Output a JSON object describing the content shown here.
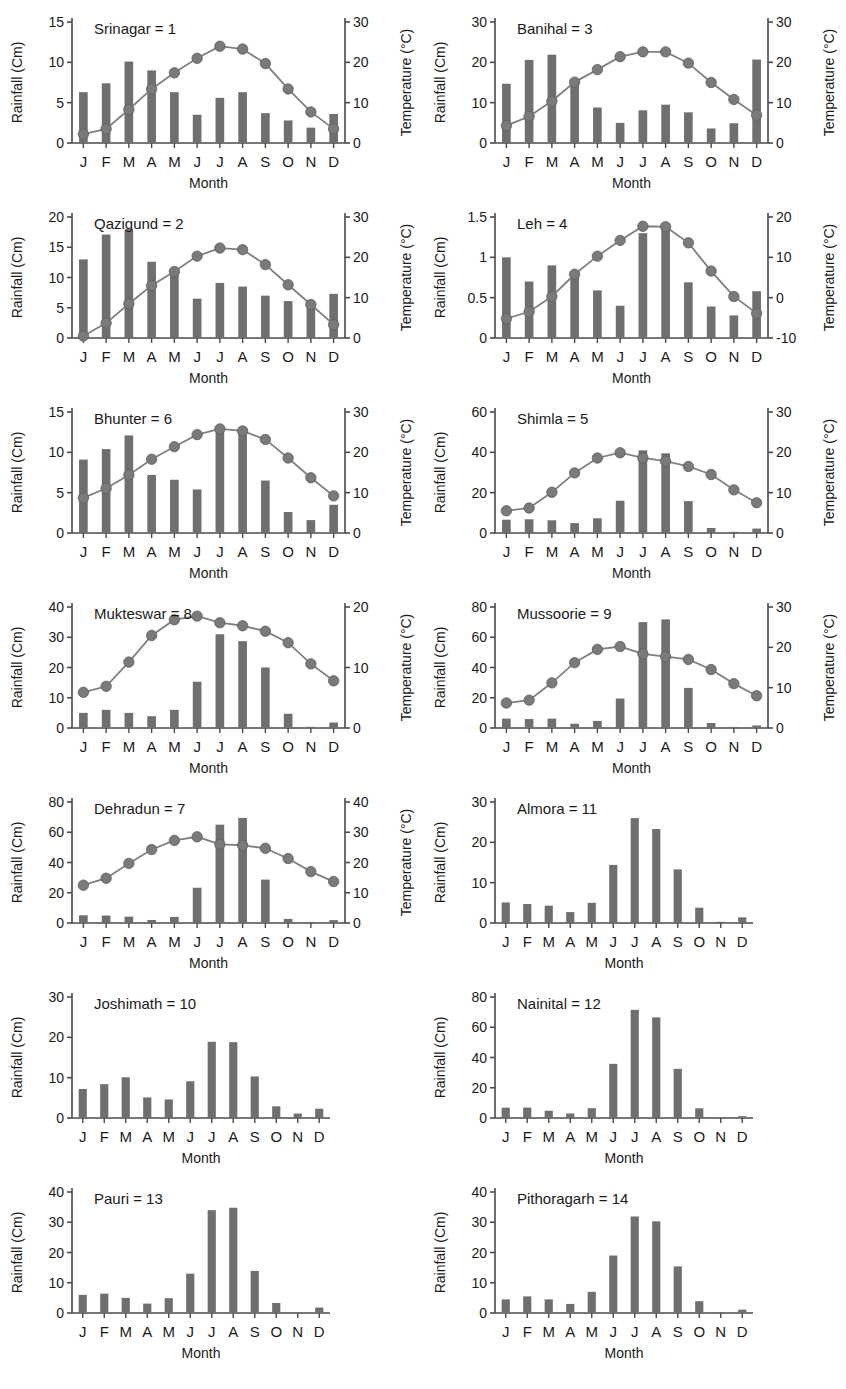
{
  "figure": {
    "bar_color": "#6f6f6f",
    "line_color": "#808080",
    "marker_color": "#7a7a7a",
    "axis_color": "#4a4a4a",
    "months": [
      "J",
      "F",
      "M",
      "A",
      "M",
      "J",
      "J",
      "A",
      "S",
      "O",
      "N",
      "D"
    ],
    "xlabel": "Month",
    "ylabel_left": "Rainfall (Cm)",
    "ylabel_right": "Temperature (°C)"
  },
  "chart_data": [
    {
      "type": "bar",
      "title": "Srinagar = 1",
      "station": "Srinagar",
      "index": 1,
      "xlabel": "Month",
      "ylabel": "Rainfall (Cm)",
      "ylabel2": "Temperature (°C)",
      "categories": [
        "J",
        "F",
        "M",
        "A",
        "M",
        "J",
        "J",
        "A",
        "S",
        "O",
        "N",
        "D"
      ],
      "ylim": [
        0,
        15
      ],
      "yticks": [
        0,
        5,
        10,
        15
      ],
      "ylim2": [
        0,
        30
      ],
      "yticks2": [
        0,
        10,
        20,
        30
      ],
      "grid": false,
      "series": [
        {
          "name": "Rainfall",
          "type": "bar",
          "axis": "left",
          "values": [
            6.3,
            7.4,
            10.1,
            9.0,
            6.3,
            3.5,
            5.6,
            6.3,
            3.7,
            2.8,
            1.9,
            3.6
          ]
        },
        {
          "name": "Temperature",
          "type": "line",
          "axis": "right",
          "values": [
            2.2,
            3.5,
            8.3,
            13.4,
            17.4,
            21.0,
            24.0,
            23.3,
            19.7,
            13.4,
            7.7,
            3.5
          ]
        }
      ]
    },
    {
      "type": "bar",
      "title": "Banihal = 3",
      "station": "Banihal",
      "index": 3,
      "xlabel": "Month",
      "ylabel": "Rainfall (Cm)",
      "ylabel2": "Temperature (°C)",
      "categories": [
        "J",
        "F",
        "M",
        "A",
        "M",
        "J",
        "J",
        "A",
        "S",
        "O",
        "N",
        "D"
      ],
      "ylim": [
        0,
        30
      ],
      "yticks": [
        0,
        10,
        20,
        30
      ],
      "ylim2": [
        0,
        30
      ],
      "yticks2": [
        0,
        10,
        20,
        30
      ],
      "grid": false,
      "series": [
        {
          "name": "Rainfall",
          "type": "bar",
          "axis": "left",
          "values": [
            14.7,
            20.6,
            21.9,
            14.6,
            8.8,
            5.0,
            8.1,
            9.5,
            7.6,
            3.6,
            4.9,
            20.7
          ]
        },
        {
          "name": "Temperature",
          "type": "line",
          "axis": "right",
          "values": [
            4.3,
            6.6,
            10.4,
            15.1,
            18.2,
            21.4,
            22.6,
            22.6,
            19.8,
            15.0,
            10.8,
            6.9
          ]
        }
      ]
    },
    {
      "type": "bar",
      "title": "Qazigund = 2",
      "station": "Qazigund",
      "index": 2,
      "xlabel": "Month",
      "ylabel": "Rainfall (Cm)",
      "ylabel2": "Temperature (°C)",
      "categories": [
        "J",
        "F",
        "M",
        "A",
        "M",
        "J",
        "J",
        "A",
        "S",
        "O",
        "N",
        "D"
      ],
      "ylim": [
        0,
        20
      ],
      "yticks": [
        0,
        5,
        10,
        15,
        20
      ],
      "ylim2": [
        0,
        30
      ],
      "yticks2": [
        0,
        10,
        20,
        30
      ],
      "grid": false,
      "series": [
        {
          "name": "Rainfall",
          "type": "bar",
          "axis": "left",
          "values": [
            13.0,
            17.1,
            18.0,
            12.6,
            10.9,
            6.5,
            9.1,
            8.5,
            7.0,
            6.1,
            5.5,
            7.3
          ]
        },
        {
          "name": "Temperature",
          "type": "line",
          "axis": "right",
          "values": [
            0.5,
            3.7,
            8.5,
            13.0,
            16.5,
            20.3,
            22.3,
            21.9,
            18.2,
            13.2,
            8.3,
            3.3
          ]
        }
      ]
    },
    {
      "type": "bar",
      "title": "Leh = 4",
      "station": "Leh",
      "index": 4,
      "xlabel": "Month",
      "ylabel": "Rainfall (Cm)",
      "ylabel2": "Temperature (°C)",
      "categories": [
        "J",
        "F",
        "M",
        "A",
        "M",
        "J",
        "J",
        "A",
        "S",
        "O",
        "N",
        "D"
      ],
      "ylim": [
        0,
        1.5
      ],
      "yticks": [
        0,
        0.5,
        1,
        1.5
      ],
      "ylim2": [
        -10,
        20
      ],
      "yticks2": [
        -10,
        0,
        10,
        20
      ],
      "grid": false,
      "series": [
        {
          "name": "Rainfall",
          "type": "bar",
          "axis": "left",
          "values": [
            1.0,
            0.7,
            0.9,
            0.81,
            0.59,
            0.4,
            1.3,
            1.38,
            0.69,
            0.39,
            0.28,
            0.58
          ]
        },
        {
          "name": "Temperature",
          "type": "line",
          "axis": "right",
          "values": [
            -5.2,
            -3.5,
            0.3,
            5.8,
            10.3,
            14.2,
            17.7,
            17.6,
            13.6,
            6.6,
            0.3,
            -3.9
          ]
        }
      ]
    },
    {
      "type": "bar",
      "title": "Bhunter = 6",
      "station": "Bhunter",
      "index": 6,
      "xlabel": "Month",
      "ylabel": "Rainfall (Cm)",
      "ylabel2": "Temperature (°C)",
      "categories": [
        "J",
        "F",
        "M",
        "A",
        "M",
        "J",
        "J",
        "A",
        "S",
        "O",
        "N",
        "D"
      ],
      "ylim": [
        0,
        15
      ],
      "yticks": [
        0,
        5,
        10,
        15
      ],
      "ylim2": [
        0,
        30
      ],
      "yticks2": [
        0,
        10,
        20,
        30
      ],
      "grid": false,
      "series": [
        {
          "name": "Rainfall",
          "type": "bar",
          "axis": "left",
          "values": [
            9.1,
            10.4,
            12.1,
            7.2,
            6.6,
            5.4,
            13.0,
            12.8,
            6.5,
            2.6,
            1.6,
            3.5
          ]
        },
        {
          "name": "Temperature",
          "type": "line",
          "axis": "right",
          "values": [
            8.7,
            11.1,
            14.4,
            18.3,
            21.4,
            24.4,
            25.8,
            25.3,
            23.2,
            18.6,
            13.7,
            9.2
          ]
        }
      ]
    },
    {
      "type": "bar",
      "title": "Shimla = 5",
      "station": "Shimla",
      "index": 5,
      "xlabel": "Month",
      "ylabel": "Rainfall (Cm)",
      "ylabel2": "Temperature (°C)",
      "categories": [
        "J",
        "F",
        "M",
        "A",
        "M",
        "J",
        "J",
        "A",
        "S",
        "O",
        "N",
        "D"
      ],
      "ylim": [
        0,
        60
      ],
      "yticks": [
        0,
        20,
        40,
        60
      ],
      "ylim2": [
        0,
        30
      ],
      "yticks2": [
        0,
        10,
        20,
        30
      ],
      "grid": false,
      "series": [
        {
          "name": "Rainfall",
          "type": "bar",
          "axis": "left",
          "values": [
            6.6,
            6.8,
            6.3,
            4.9,
            7.3,
            16.0,
            41.0,
            39.5,
            15.8,
            2.5,
            0.6,
            2.2
          ]
        },
        {
          "name": "Temperature",
          "type": "line",
          "axis": "right",
          "values": [
            5.5,
            6.2,
            10.1,
            14.9,
            18.6,
            19.9,
            18.6,
            17.8,
            16.5,
            14.5,
            10.7,
            7.5
          ]
        }
      ]
    },
    {
      "type": "bar",
      "title": "Mukteswar = 8",
      "station": "Mukteswar",
      "index": 8,
      "xlabel": "Month",
      "ylabel": "Rainfall (Cm)",
      "ylabel2": "Temperature (°C)",
      "categories": [
        "J",
        "F",
        "M",
        "A",
        "M",
        "J",
        "J",
        "A",
        "S",
        "O",
        "N",
        "D"
      ],
      "ylim": [
        0,
        40
      ],
      "yticks": [
        0,
        10,
        20,
        30,
        40
      ],
      "ylim2": [
        0,
        20
      ],
      "yticks2": [
        0,
        10,
        20
      ],
      "grid": false,
      "series": [
        {
          "name": "Rainfall",
          "type": "bar",
          "axis": "left",
          "values": [
            5.0,
            6.0,
            5.0,
            3.9,
            6.0,
            15.3,
            31.0,
            28.7,
            20.0,
            4.7,
            0.4,
            1.8
          ]
        },
        {
          "name": "Temperature",
          "type": "line",
          "axis": "right",
          "values": [
            5.9,
            6.9,
            10.9,
            15.3,
            17.9,
            18.5,
            17.4,
            16.9,
            16.0,
            14.1,
            10.6,
            7.8
          ]
        }
      ]
    },
    {
      "type": "bar",
      "title": "Mussoorie = 9",
      "station": "Mussoorie",
      "index": 9,
      "xlabel": "Month",
      "ylabel": "Rainfall (Cm)",
      "ylabel2": "Temperature (°C)",
      "categories": [
        "J",
        "F",
        "M",
        "A",
        "M",
        "J",
        "J",
        "A",
        "S",
        "O",
        "N",
        "D"
      ],
      "ylim": [
        0,
        80
      ],
      "yticks": [
        0,
        20,
        40,
        60,
        80
      ],
      "ylim2": [
        0,
        30
      ],
      "yticks2": [
        0,
        10,
        20,
        30
      ],
      "grid": false,
      "series": [
        {
          "name": "Rainfall",
          "type": "bar",
          "axis": "left",
          "values": [
            6.2,
            5.9,
            6.2,
            2.8,
            4.7,
            19.5,
            70.0,
            71.8,
            26.5,
            3.3,
            0.7,
            1.7
          ]
        },
        {
          "name": "Temperature",
          "type": "line",
          "axis": "right",
          "values": [
            6.2,
            6.9,
            11.2,
            16.2,
            19.5,
            20.2,
            18.4,
            17.7,
            17.0,
            14.5,
            11.0,
            8.0
          ]
        }
      ]
    },
    {
      "type": "bar",
      "title": "Dehradun = 7",
      "station": "Dehradun",
      "index": 7,
      "xlabel": "Month",
      "ylabel": "Rainfall (Cm)",
      "ylabel2": "Temperature (°C)",
      "categories": [
        "J",
        "F",
        "M",
        "A",
        "M",
        "J",
        "J",
        "A",
        "S",
        "O",
        "N",
        "D"
      ],
      "ylim": [
        0,
        80
      ],
      "yticks": [
        0,
        20,
        40,
        60,
        80
      ],
      "ylim2": [
        0,
        40
      ],
      "yticks2": [
        0,
        10,
        20,
        30,
        40
      ],
      "grid": false,
      "series": [
        {
          "name": "Rainfall",
          "type": "bar",
          "axis": "left",
          "values": [
            5.1,
            4.9,
            4.2,
            2.0,
            4.0,
            23.3,
            65.0,
            69.5,
            28.7,
            2.7,
            0.7,
            1.9
          ]
        },
        {
          "name": "Temperature",
          "type": "line",
          "axis": "right",
          "values": [
            12.5,
            14.8,
            19.7,
            24.3,
            27.3,
            28.5,
            26.0,
            25.7,
            24.7,
            21.3,
            17.0,
            13.7
          ]
        }
      ]
    },
    {
      "type": "bar",
      "title": "Almora = 11",
      "station": "Almora",
      "index": 11,
      "xlabel": "Month",
      "ylabel": "Rainfall (Cm)",
      "categories": [
        "J",
        "F",
        "M",
        "A",
        "M",
        "J",
        "J",
        "A",
        "S",
        "O",
        "N",
        "D"
      ],
      "ylim": [
        0,
        30
      ],
      "yticks": [
        0,
        10,
        20,
        30
      ],
      "grid": false,
      "series": [
        {
          "name": "Rainfall",
          "type": "bar",
          "axis": "left",
          "values": [
            5.1,
            4.7,
            4.3,
            2.7,
            5.0,
            14.4,
            26.0,
            23.3,
            13.3,
            3.8,
            0.3,
            1.4
          ]
        }
      ]
    },
    {
      "type": "bar",
      "title": "Joshimath = 10",
      "station": "Joshimath",
      "index": 10,
      "xlabel": "Month",
      "ylabel": "Rainfall (Cm)",
      "categories": [
        "J",
        "F",
        "M",
        "A",
        "M",
        "J",
        "J",
        "A",
        "S",
        "O",
        "N",
        "D"
      ],
      "ylim": [
        0,
        30
      ],
      "yticks": [
        0,
        10,
        20,
        30
      ],
      "grid": false,
      "series": [
        {
          "name": "Rainfall",
          "type": "bar",
          "axis": "left",
          "values": [
            7.2,
            8.4,
            10.1,
            5.1,
            4.6,
            9.1,
            18.9,
            18.8,
            10.3,
            2.9,
            1.1,
            2.3
          ]
        }
      ]
    },
    {
      "type": "bar",
      "title": "Nainital = 12",
      "station": "Nainital",
      "index": 12,
      "xlabel": "Month",
      "ylabel": "Rainfall (Cm)",
      "categories": [
        "J",
        "F",
        "M",
        "A",
        "M",
        "J",
        "J",
        "A",
        "S",
        "O",
        "N",
        "D"
      ],
      "ylim": [
        0,
        80
      ],
      "yticks": [
        0,
        20,
        40,
        60,
        80
      ],
      "grid": false,
      "series": [
        {
          "name": "Rainfall",
          "type": "bar",
          "axis": "left",
          "values": [
            6.8,
            6.9,
            4.8,
            3.0,
            6.5,
            35.8,
            71.5,
            66.5,
            32.5,
            6.4,
            0.5,
            1.2
          ]
        }
      ]
    },
    {
      "type": "bar",
      "title": "Pauri = 13",
      "station": "Pauri",
      "index": 13,
      "xlabel": "Month",
      "ylabel": "Rainfall (Cm)",
      "categories": [
        "J",
        "F",
        "M",
        "A",
        "M",
        "J",
        "J",
        "A",
        "S",
        "O",
        "N",
        "D"
      ],
      "ylim": [
        0,
        40
      ],
      "yticks": [
        0,
        10,
        20,
        30,
        40
      ],
      "grid": false,
      "series": [
        {
          "name": "Rainfall",
          "type": "bar",
          "axis": "left",
          "values": [
            6.0,
            6.4,
            5.0,
            3.1,
            4.9,
            13.0,
            34.0,
            34.8,
            13.9,
            3.3,
            0.3,
            1.8
          ]
        }
      ]
    },
    {
      "type": "bar",
      "title": "Pithoragarh = 14",
      "station": "Pithoragarh",
      "index": 14,
      "xlabel": "Month",
      "ylabel": "Rainfall (Cm)",
      "categories": [
        "J",
        "F",
        "M",
        "A",
        "M",
        "J",
        "J",
        "A",
        "S",
        "O",
        "N",
        "D"
      ],
      "ylim": [
        0,
        40
      ],
      "yticks": [
        0,
        10,
        20,
        30,
        40
      ],
      "grid": false,
      "series": [
        {
          "name": "Rainfall",
          "type": "bar",
          "axis": "left",
          "values": [
            4.5,
            5.5,
            4.5,
            3.0,
            7.0,
            19.0,
            31.9,
            30.3,
            15.4,
            3.9,
            0.3,
            1.1
          ]
        }
      ]
    }
  ]
}
